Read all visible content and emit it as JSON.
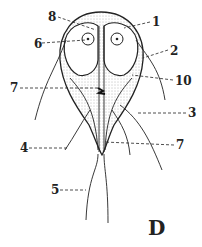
{
  "figure": {
    "panel_letter": "D",
    "labels": [
      {
        "id": "1",
        "text": "1",
        "x": 152,
        "y": 16
      },
      {
        "id": "2",
        "text": "2",
        "x": 170,
        "y": 45
      },
      {
        "id": "3",
        "text": "3",
        "x": 188,
        "y": 107
      },
      {
        "id": "4",
        "text": "4",
        "x": 20,
        "y": 142
      },
      {
        "id": "5",
        "text": "5",
        "x": 51,
        "y": 184
      },
      {
        "id": "6",
        "text": "6",
        "x": 34,
        "y": 38
      },
      {
        "id": "7",
        "text": "7",
        "x": 176,
        "y": 139
      },
      {
        "id": "8",
        "text": "8",
        "x": 48,
        "y": 11
      },
      {
        "id": "9",
        "text": "9",
        "x": 10,
        "y": 82
      },
      {
        "id": "10",
        "text": "10",
        "x": 175,
        "y": 75
      }
    ]
  },
  "colors": {
    "ink": "#222222",
    "stipple": "#bdbdbd",
    "background": "#ffffff"
  }
}
